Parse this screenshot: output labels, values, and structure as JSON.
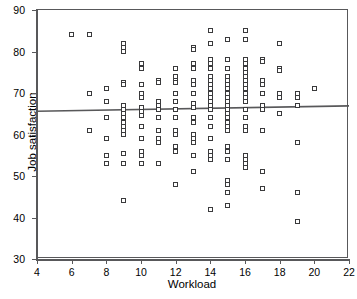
{
  "chart_data": {
    "type": "scatter",
    "title": "",
    "xlabel": "Workload",
    "ylabel": "Job satisfaction",
    "xlim": [
      4,
      22
    ],
    "ylim": [
      30,
      90
    ],
    "xticks": [
      4,
      6,
      8,
      10,
      12,
      14,
      16,
      18,
      20,
      22
    ],
    "yticks": [
      30,
      40,
      50,
      60,
      70,
      80,
      90
    ],
    "grid": false,
    "legend": null,
    "marker_style": "open-square",
    "marker_color": "#3a3a3c",
    "frame_color": "#58585a",
    "trendline": {
      "type": "linear-fit",
      "color": "#58585a",
      "x_start": 4,
      "y_start": 65.6,
      "x_end": 22,
      "y_end": 66.9
    },
    "points": [
      [
        6,
        84
      ],
      [
        7,
        84
      ],
      [
        7,
        70
      ],
      [
        7,
        61
      ],
      [
        8,
        71
      ],
      [
        8,
        68
      ],
      [
        8,
        64
      ],
      [
        8,
        59
      ],
      [
        8,
        55
      ],
      [
        8,
        53
      ],
      [
        9,
        82
      ],
      [
        9,
        81
      ],
      [
        9,
        80
      ],
      [
        9,
        72.5
      ],
      [
        9,
        72
      ],
      [
        9,
        67
      ],
      [
        9,
        66
      ],
      [
        9,
        65
      ],
      [
        9,
        64
      ],
      [
        9,
        63
      ],
      [
        9,
        62
      ],
      [
        9,
        61
      ],
      [
        9,
        60
      ],
      [
        9,
        55.5
      ],
      [
        9,
        53
      ],
      [
        9,
        44
      ],
      [
        10,
        77
      ],
      [
        10,
        76
      ],
      [
        10,
        72
      ],
      [
        10,
        70
      ],
      [
        10,
        69
      ],
      [
        10,
        66.5
      ],
      [
        10,
        65.5
      ],
      [
        10,
        64.5
      ],
      [
        10,
        62
      ],
      [
        10,
        59
      ],
      [
        10,
        56
      ],
      [
        10,
        55
      ],
      [
        10,
        53
      ],
      [
        11,
        73
      ],
      [
        11,
        72.5
      ],
      [
        11,
        68
      ],
      [
        11,
        67
      ],
      [
        11,
        66
      ],
      [
        11,
        64
      ],
      [
        11,
        61
      ],
      [
        11,
        59
      ],
      [
        11,
        58
      ],
      [
        11,
        53
      ],
      [
        12,
        76
      ],
      [
        12,
        74
      ],
      [
        12,
        73
      ],
      [
        12,
        72.5
      ],
      [
        12,
        70
      ],
      [
        12,
        68
      ],
      [
        12,
        66
      ],
      [
        12,
        64
      ],
      [
        12,
        61
      ],
      [
        12,
        60
      ],
      [
        12,
        57
      ],
      [
        12,
        56
      ],
      [
        12,
        48
      ],
      [
        13,
        81
      ],
      [
        13,
        80.5
      ],
      [
        13,
        77
      ],
      [
        13,
        76
      ],
      [
        13,
        73
      ],
      [
        13,
        72
      ],
      [
        13,
        70
      ],
      [
        13,
        67.5
      ],
      [
        13,
        66.5
      ],
      [
        13,
        64
      ],
      [
        13,
        63
      ],
      [
        13,
        60
      ],
      [
        13,
        59
      ],
      [
        13,
        58
      ],
      [
        13,
        55
      ],
      [
        13,
        51
      ],
      [
        14,
        85
      ],
      [
        14,
        82
      ],
      [
        14,
        78
      ],
      [
        14,
        77
      ],
      [
        14,
        76
      ],
      [
        14,
        74
      ],
      [
        14,
        73
      ],
      [
        14,
        72
      ],
      [
        14,
        71
      ],
      [
        14,
        70
      ],
      [
        14,
        69
      ],
      [
        14,
        68
      ],
      [
        14,
        67
      ],
      [
        14,
        66
      ],
      [
        14,
        64
      ],
      [
        14,
        62
      ],
      [
        14,
        59
      ],
      [
        14,
        56
      ],
      [
        14,
        55
      ],
      [
        14,
        54
      ],
      [
        14,
        42
      ],
      [
        15,
        83
      ],
      [
        15,
        78
      ],
      [
        15,
        76
      ],
      [
        15,
        74
      ],
      [
        15,
        73
      ],
      [
        15,
        72
      ],
      [
        15,
        71
      ],
      [
        15,
        70
      ],
      [
        15,
        69
      ],
      [
        15,
        68
      ],
      [
        15,
        67
      ],
      [
        15,
        66
      ],
      [
        15,
        65
      ],
      [
        15,
        64
      ],
      [
        15,
        63
      ],
      [
        15,
        62
      ],
      [
        15,
        61
      ],
      [
        15,
        57
      ],
      [
        15,
        56
      ],
      [
        15,
        54
      ],
      [
        15,
        49
      ],
      [
        15,
        48
      ],
      [
        15,
        46
      ],
      [
        15,
        43
      ],
      [
        16,
        85
      ],
      [
        16,
        83
      ],
      [
        16,
        78
      ],
      [
        16,
        77
      ],
      [
        16,
        76
      ],
      [
        16,
        75
      ],
      [
        16,
        74
      ],
      [
        16,
        73
      ],
      [
        16,
        72
      ],
      [
        16,
        71
      ],
      [
        16,
        70
      ],
      [
        16,
        69
      ],
      [
        16,
        68
      ],
      [
        16,
        66
      ],
      [
        16,
        64
      ],
      [
        16,
        62
      ],
      [
        16,
        61
      ],
      [
        16,
        55
      ],
      [
        16,
        54
      ],
      [
        16,
        53
      ],
      [
        16,
        52
      ],
      [
        17,
        78
      ],
      [
        17,
        77.5
      ],
      [
        17,
        73
      ],
      [
        17,
        72
      ],
      [
        17,
        70
      ],
      [
        17,
        67
      ],
      [
        17,
        66
      ],
      [
        17,
        61
      ],
      [
        17,
        51
      ],
      [
        17,
        47
      ],
      [
        18,
        82
      ],
      [
        18,
        76
      ],
      [
        18,
        75.5
      ],
      [
        18,
        70
      ],
      [
        18,
        69
      ],
      [
        18,
        65
      ],
      [
        19,
        70
      ],
      [
        19,
        69
      ],
      [
        19,
        67
      ],
      [
        19,
        58
      ],
      [
        19,
        46
      ],
      [
        19,
        39
      ],
      [
        20,
        71
      ]
    ]
  },
  "axes": {
    "xlabel": "Workload",
    "ylabel": "Job satisfaction"
  }
}
